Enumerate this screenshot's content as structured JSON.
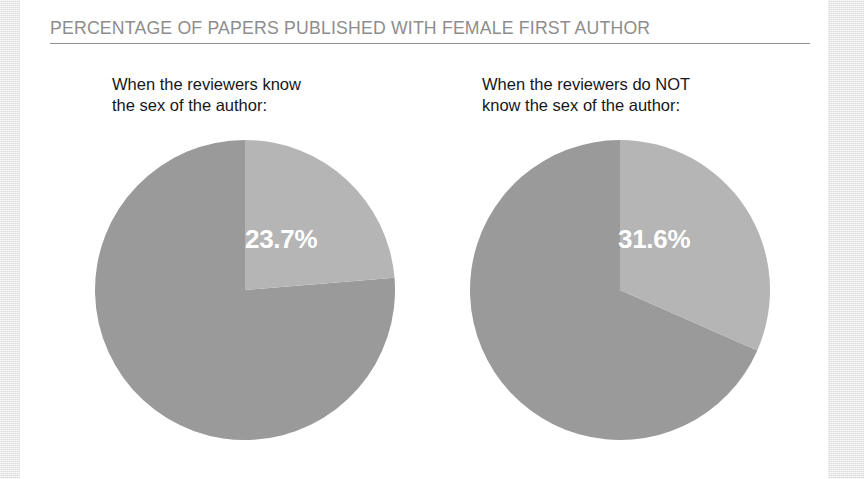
{
  "figure": {
    "title": "PERCENTAGE OF PAPERS PUBLISHED WITH FEMALE FIRST AUTHOR",
    "title_color": "#8d8d8d",
    "rule_color": "#8f8f92",
    "panel_background": "#ffffff",
    "page_background": "#eaeaea"
  },
  "palette": {
    "highlight_slice": "#b5b5b5",
    "remainder_slice": "#9a9a9a",
    "label_text": "#ffffff",
    "caption_text": "#17171a"
  },
  "panels": [
    {
      "id": "reviewers-know-sex",
      "caption": "When the reviewers know\nthe sex of the author:",
      "value_label": "23.7%"
    },
    {
      "id": "reviewers-do-not-know-sex",
      "caption": "When the reviewers do NOT\nknow the sex of the author:",
      "value_label": "31.6%"
    }
  ],
  "chart_data": {
    "type": "pie",
    "title": "PERCENTAGE OF PAPERS PUBLISHED WITH FEMALE FIRST AUTHOR",
    "subtitle": "",
    "xlabel": "",
    "ylabel": "",
    "grid": false,
    "legend_position": "none",
    "units": "percent",
    "start_angle_deg": 0,
    "direction": "clockwise",
    "charts": [
      {
        "name": "When the reviewers know the sex of the author:",
        "categories": [
          "Female first author",
          "Other"
        ],
        "values": [
          23.7,
          76.3
        ],
        "colors": [
          "#b5b5b5",
          "#9a9a9a"
        ],
        "data_labels": [
          "23.7%",
          ""
        ],
        "sweep_deg": [
          85.3,
          274.7
        ]
      },
      {
        "name": "When the reviewers do NOT know the sex of the author:",
        "categories": [
          "Female first author",
          "Other"
        ],
        "values": [
          31.6,
          68.4
        ],
        "colors": [
          "#b5b5b5",
          "#9a9a9a"
        ],
        "data_labels": [
          "31.6%",
          ""
        ],
        "sweep_deg": [
          113.8,
          246.2
        ]
      }
    ]
  }
}
